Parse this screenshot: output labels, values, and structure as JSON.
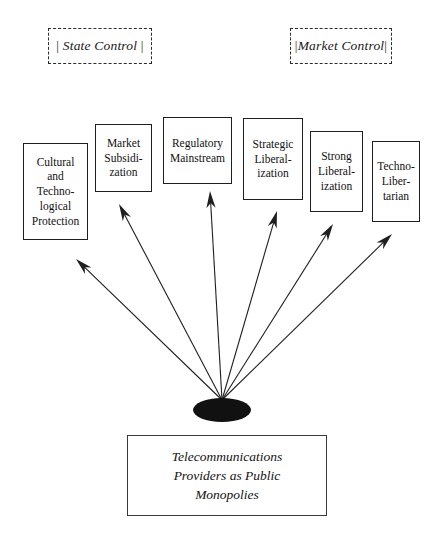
{
  "diagram": {
    "title_hidden": "",
    "axis_labels": [
      {
        "name": "state-control",
        "text": "State Control",
        "bracket_left": "|",
        "bracket_right": "|",
        "x": 48,
        "y": 28,
        "w": 104,
        "h": 36
      },
      {
        "name": "market-control",
        "text": "Market Control",
        "bracket_left": "|",
        "bracket_right": "|",
        "x": 290,
        "y": 28,
        "w": 102,
        "h": 36
      }
    ],
    "categories": [
      {
        "name": "cultural-and-technological-protection",
        "label": "Cultural\nand\nTechno-\nlogical\nProtection",
        "x": 23,
        "y": 143,
        "w": 65,
        "h": 97,
        "arrow_tip_x": 76,
        "arrow_tip_y": 259
      },
      {
        "name": "market-subsidization",
        "label": "Market\nSubsidi-\nzation",
        "x": 95,
        "y": 124,
        "w": 57,
        "h": 68,
        "arrow_tip_x": 119,
        "arrow_tip_y": 204
      },
      {
        "name": "regulatory-mainstream",
        "label": "Regulatory\nMainstream",
        "x": 163,
        "y": 117,
        "w": 69,
        "h": 67,
        "arrow_tip_x": 210,
        "arrow_tip_y": 191
      },
      {
        "name": "strategic-liberalization",
        "label": "Strategic\nLiberal-\nization",
        "x": 243,
        "y": 118,
        "w": 60,
        "h": 82,
        "arrow_tip_x": 277,
        "arrow_tip_y": 211
      },
      {
        "name": "strong-liberalization",
        "label": "Strong\nLiberal-\nization",
        "x": 310,
        "y": 131,
        "w": 53,
        "h": 81,
        "arrow_tip_x": 333,
        "arrow_tip_y": 224
      },
      {
        "name": "techno-libertarian",
        "label": "Techno-\nLiber-\ntarian",
        "x": 372,
        "y": 141,
        "w": 48,
        "h": 81,
        "arrow_tip_x": 392,
        "arrow_tip_y": 234
      }
    ],
    "hub": {
      "name": "origin-node",
      "cx": 222,
      "cy": 410,
      "rx": 29,
      "ry": 12,
      "fill": "#111111"
    },
    "source": {
      "name": "telecommunications-providers-box",
      "label": "Telecommunications\nProviders as Public\nMonopolies"
    },
    "colors": {
      "stroke": "#1f1f1f",
      "dashed_stroke": "#2b2b2b",
      "text": "#111111",
      "hub_fill": "#111111",
      "background": "#ffffff"
    }
  }
}
